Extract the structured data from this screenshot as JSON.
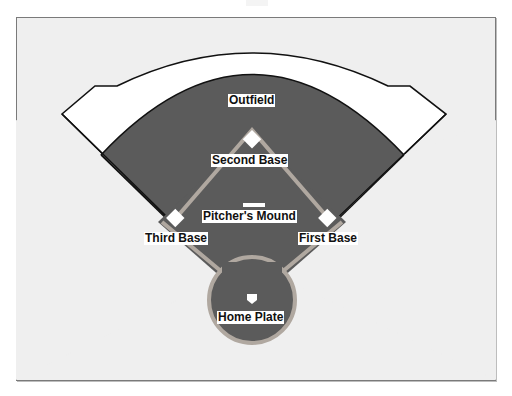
{
  "diagram": {
    "labels": {
      "outfield": "Outfield",
      "second_base": "Second Base",
      "pitchers_mound": "Pitcher's Mound",
      "third_base": "Third Base",
      "first_base": "First Base",
      "home_plate": "Home Plate"
    },
    "colors": {
      "background": "#efefef",
      "grass": "#5a5a5a",
      "warning_track": "#ffffff",
      "base_path": "#b0a8a0",
      "outline": "#111111",
      "base": "#ffffff"
    }
  }
}
